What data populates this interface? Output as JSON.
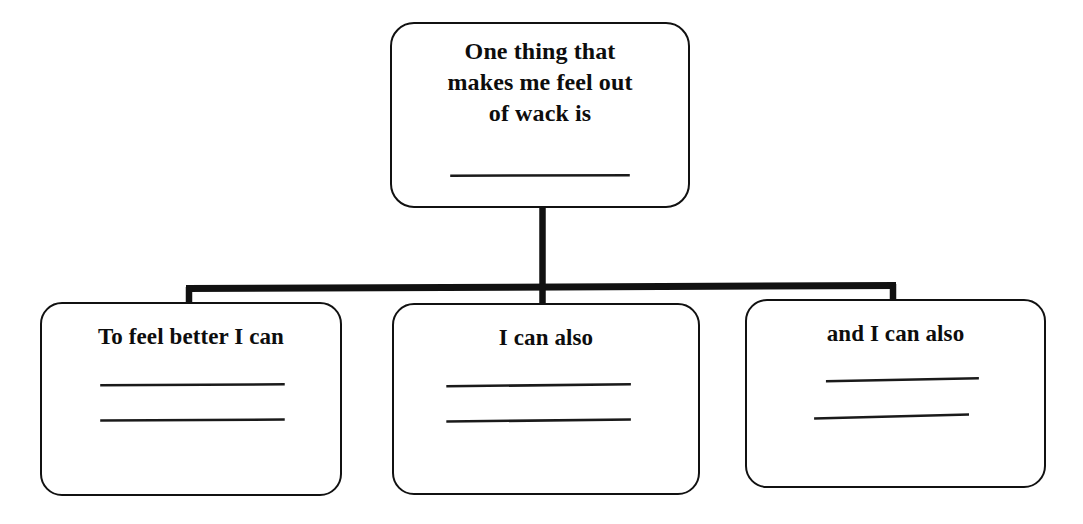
{
  "document": {
    "type": "fill-in-the-blank worksheet diagram",
    "background_color": "#ffffff",
    "ink_color": "#111111"
  },
  "diagram": {
    "root": {
      "id": "root",
      "text_lines": [
        "One thing that",
        "makes me feel out",
        "of wack is"
      ],
      "full_text": "One thing that makes me feel out of wack is",
      "blank_lines": 1
    },
    "children": [
      {
        "id": "leaf-0",
        "text_lines": [
          "To feel better I can"
        ],
        "full_text": "To feel better I can",
        "blank_lines": 2
      },
      {
        "id": "leaf-1",
        "text_lines": [
          "I can also"
        ],
        "full_text": "I can also",
        "blank_lines": 2
      },
      {
        "id": "leaf-2",
        "text_lines": [
          "and I can also"
        ],
        "full_text": "and I can also",
        "blank_lines": 2
      }
    ],
    "connector": {
      "style": "orthogonal-tree",
      "stem_from_root": true,
      "branch_count": 3
    }
  }
}
